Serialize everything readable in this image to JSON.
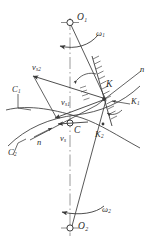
{
  "figure": {
    "type": "kinematic-contact-diagram",
    "background": "#ffffff",
    "line_color": "#3a3a3a",
    "axis_color": "#9a9a9a"
  },
  "labels": {
    "O1": {
      "base": "O",
      "sub": "1"
    },
    "O2": {
      "base": "O",
      "sub": "2"
    },
    "omega1": {
      "base": "ω",
      "sub": "1"
    },
    "omega2": {
      "base": "ω",
      "sub": "2"
    },
    "K": {
      "base": "K",
      "sub": ""
    },
    "K1": {
      "base": "K",
      "sub": "1"
    },
    "K2": {
      "base": "K",
      "sub": "2"
    },
    "C": {
      "base": "C",
      "sub": ""
    },
    "C1": {
      "base": "C",
      "sub": "1"
    },
    "C2": {
      "base": "C",
      "sub": "2"
    },
    "vs": {
      "base": "v",
      "sub": "s"
    },
    "vs1": {
      "base": "v",
      "sub": "s1"
    },
    "vs2": {
      "base": "v",
      "sub": "s2"
    },
    "n_left": {
      "base": "n",
      "sub": ""
    },
    "n_right": {
      "base": "n",
      "sub": ""
    }
  },
  "markers": {
    "O1_point": "open-circle-crosshair",
    "O2_point": "open-circle-crosshair",
    "C_point": "open-circle",
    "K_point": "filled-node"
  },
  "vectors": [
    {
      "name": "vs2",
      "from": "K",
      "to": "upper-left",
      "label": "v_s2"
    },
    {
      "name": "vs1",
      "from": "K",
      "to": "left",
      "label": "v_s1"
    },
    {
      "name": "vs",
      "from": "C",
      "to": "left",
      "label": "v_s"
    }
  ],
  "curves": [
    {
      "name": "C1",
      "role": "upper-profile-curve"
    },
    {
      "name": "C2",
      "role": "lower-profile-curve"
    }
  ]
}
